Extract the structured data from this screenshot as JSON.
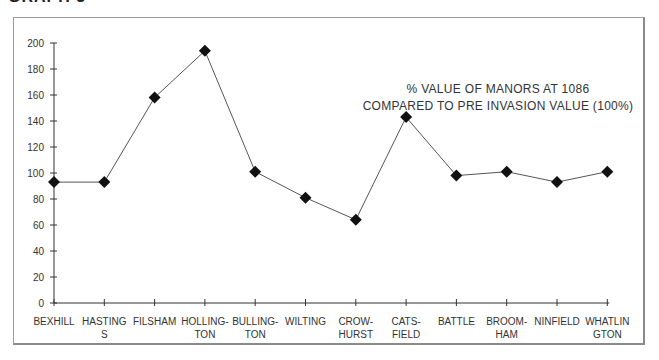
{
  "page": {
    "heading": "GRAPH 3"
  },
  "chart_data": {
    "type": "line",
    "title": "% VALUE OF MANORS AT 1086",
    "subtitle": "COMPARED TO PRE INVASION VALUE (100%)",
    "title_lines": [
      "% VALUE OF MANORS AT 1086",
      "COMPARED TO PRE INVASION VALUE (100%)"
    ],
    "xlabel": "",
    "ylabel": "",
    "categories": [
      "BEXHILL",
      "HASTINGS",
      "FILSHAM",
      "HOLLINGTON",
      "BULLINGTON",
      "WILTING",
      "CROWHURST",
      "CATSFIELD",
      "BATTLE",
      "BROOMHAM",
      "NINFIELD",
      "WHATLINGTON"
    ],
    "category_label_lines": [
      [
        "BEXHILL"
      ],
      [
        "HASTING",
        "S"
      ],
      [
        "FILSHAM"
      ],
      [
        "HOLLING-",
        "TON"
      ],
      [
        "BULLING-",
        "TON"
      ],
      [
        "WILTING"
      ],
      [
        "CROW-",
        "HURST"
      ],
      [
        "CATS-",
        "FIELD"
      ],
      [
        "BATTLE"
      ],
      [
        "BROOM-",
        "HAM"
      ],
      [
        "NINFIELD"
      ],
      [
        "WHATLIN",
        "GTON"
      ]
    ],
    "series": [
      {
        "name": "% value at 1086",
        "values": [
          93,
          93,
          158,
          194,
          101,
          81,
          64,
          143,
          98,
          101,
          93,
          101
        ],
        "marker": "diamond",
        "color": "#111111"
      }
    ],
    "ylim": [
      0,
      200
    ],
    "yticks": [
      0,
      20,
      40,
      60,
      80,
      100,
      120,
      140,
      160,
      180,
      200
    ],
    "grid": false,
    "legend": "none"
  }
}
